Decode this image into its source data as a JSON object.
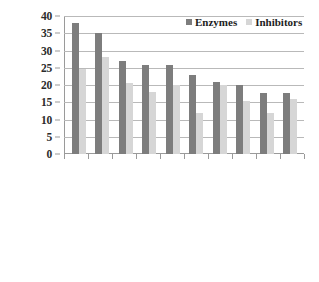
{
  "chart_data": {
    "type": "bar",
    "title": "",
    "subtitle": "",
    "xlabel": "",
    "ylabel": "",
    "ylim": [
      0,
      40
    ],
    "ytick_step": 5,
    "yticks": [
      "40",
      "35",
      "30",
      "25",
      "20",
      "15",
      "10",
      "5",
      "0"
    ],
    "grid": true,
    "legend_position": "top-right",
    "categories": [
      "Purine metabolism",
      "Glycerolipid metabolism",
      "Arginine and proline metabolism",
      "Glycolysis/gluconeogenesis",
      "Pyrimidine metabolism",
      "Glycine, serine and threonine",
      "Aminoacyl-tRNA synthesis",
      "Pyruvate metabolism",
      "Valine, leucine and threonine",
      "Tryptophan metabolism"
    ],
    "series": [
      {
        "name": "Enzymes",
        "color": "#7d7d7d",
        "values": [
          38,
          35,
          27,
          25.8,
          25.8,
          23,
          21,
          20,
          17.8,
          17.8
        ]
      },
      {
        "name": "Inhibitors",
        "color": "#d6d6d6",
        "values": [
          24.5,
          28,
          20.5,
          18,
          20,
          12,
          20,
          15.5,
          12,
          16
        ]
      }
    ]
  },
  "legend": {
    "items": [
      {
        "label": "Enzymes"
      },
      {
        "label": "Inhibitors"
      }
    ]
  },
  "colors": {
    "enzymes": "#7d7d7d",
    "inhibitors": "#d6d6d6",
    "axis": "#9a9a9a",
    "grid": "#b9b9b9",
    "text": "#1d1d1d",
    "background": "#ffffff"
  }
}
